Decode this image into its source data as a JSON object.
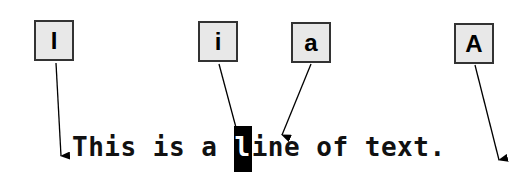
{
  "labels": [
    {
      "id": "glyph-capital-I",
      "text": "I"
    },
    {
      "id": "glyph-lower-i",
      "text": "i"
    },
    {
      "id": "glyph-lower-a",
      "text": "a"
    },
    {
      "id": "glyph-capital-A",
      "text": "A"
    }
  ],
  "sentence": {
    "before": "This is a ",
    "cursor_char": "l",
    "after": "ine of text."
  }
}
